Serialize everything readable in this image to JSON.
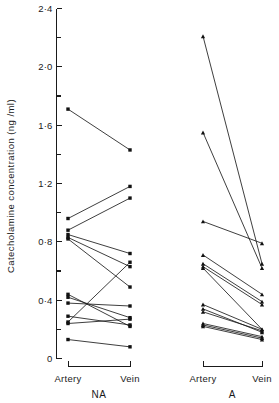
{
  "chart_data": {
    "type": "scatter",
    "title": "",
    "subtitle": "",
    "xlabel": "",
    "ylabel": "Catecholamine  concentration  (ng /ml)",
    "ylim": [
      0,
      2.4
    ],
    "y_major_ticks": [
      0,
      0.4,
      0.8,
      1.2,
      1.6,
      2.0,
      2.4
    ],
    "y_major_tick_labels": [
      "0",
      "0·4",
      "0·8",
      "1·2",
      "1·6",
      "2·0",
      "2·4"
    ],
    "y_minor_ticks": [
      0.2,
      0.6,
      1.0,
      1.4,
      1.8,
      2.2
    ],
    "grid": false,
    "legend": "none",
    "categories": [
      "Artery",
      "Vein"
    ],
    "panels": [
      {
        "name": "NA",
        "label": "NA",
        "marker": "square",
        "x_tick_labels": [
          "Artery",
          "Vein"
        ],
        "pairs": [
          {
            "artery": 1.71,
            "vein": 1.43
          },
          {
            "artery": 0.96,
            "vein": 1.18
          },
          {
            "artery": 0.88,
            "vein": 1.1
          },
          {
            "artery": 0.85,
            "vein": 0.72
          },
          {
            "artery": 0.83,
            "vein": 0.63
          },
          {
            "artery": 0.82,
            "vein": 0.49
          },
          {
            "artery": 0.44,
            "vein": 0.22
          },
          {
            "artery": 0.42,
            "vein": 0.28
          },
          {
            "artery": 0.38,
            "vein": 0.36
          },
          {
            "artery": 0.29,
            "vein": 0.23
          },
          {
            "artery": 0.25,
            "vein": 0.66
          },
          {
            "artery": 0.24,
            "vein": 0.27
          },
          {
            "artery": 0.13,
            "vein": 0.08
          }
        ]
      },
      {
        "name": "A",
        "label": "A",
        "marker": "triangle",
        "x_tick_labels": [
          "Artery",
          "Vein"
        ],
        "pairs": [
          {
            "artery": 2.21,
            "vein": 0.65
          },
          {
            "artery": 1.55,
            "vein": 0.62
          },
          {
            "artery": 0.94,
            "vein": 0.79
          },
          {
            "artery": 0.71,
            "vein": 0.44
          },
          {
            "antery": null,
            "artery": 0.65,
            "vein": 0.39
          },
          {
            "artery": 0.63,
            "vein": 0.37
          },
          {
            "artery": 0.62,
            "vein": 0.2
          },
          {
            "artery": 0.37,
            "vein": 0.2
          },
          {
            "artery": 0.34,
            "vein": 0.18
          },
          {
            "artery": 0.32,
            "vein": 0.19
          },
          {
            "artery": 0.24,
            "vein": 0.15
          },
          {
            "artery": 0.23,
            "vein": 0.14
          },
          {
            "artery": 0.22,
            "vein": 0.13
          }
        ]
      }
    ],
    "colors": {
      "marker": "#111111",
      "line": "#1c1c1c",
      "axis": "#1a1a1a",
      "background": "#ffffff"
    }
  }
}
